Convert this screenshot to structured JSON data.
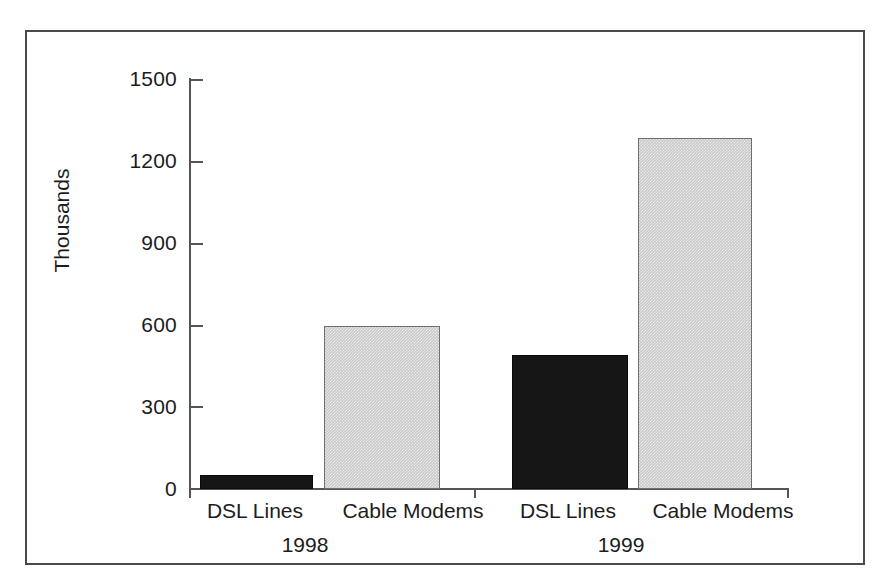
{
  "figure": {
    "background_color": "#ffffff",
    "frame_color": "#4a4a4a"
  },
  "chart_data": {
    "type": "bar",
    "title": "",
    "subtitle": "",
    "xlabel": "",
    "ylabel": "Thousands",
    "ylim": [
      0,
      1500
    ],
    "yticks": [
      0,
      300,
      600,
      900,
      1200,
      1500
    ],
    "ytick_labels": [
      "0",
      "300",
      "600",
      "900",
      "1200",
      "1500"
    ],
    "grid": false,
    "legend": "none",
    "groups": [
      "1998",
      "1999"
    ],
    "categories": [
      "DSL Lines",
      "Cable Modems"
    ],
    "series": [
      {
        "name": "DSL Lines",
        "color": "#161616",
        "values": [
          50,
          490
        ]
      },
      {
        "name": "Cable Modems",
        "color": "#c9c9c9",
        "values": [
          595,
          1285
        ]
      }
    ],
    "bars": [
      {
        "group": "1998",
        "category": "DSL Lines",
        "value": 50,
        "style": "dark"
      },
      {
        "group": "1998",
        "category": "Cable Modems",
        "value": 595,
        "style": "light"
      },
      {
        "group": "1999",
        "category": "DSL Lines",
        "value": 490,
        "style": "dark"
      },
      {
        "group": "1999",
        "category": "Cable Modems",
        "value": 1285,
        "style": "light"
      }
    ],
    "annotations": []
  },
  "axis_labels": {
    "g1_cat1": "DSL Lines",
    "g1_cat2": "Cable Modems",
    "g1_group": "1998",
    "g2_cat1": "DSL Lines",
    "g2_cat2": "Cable Modems",
    "g2_group": "1999"
  },
  "ytick_text": {
    "t0": "0",
    "t1": "300",
    "t2": "600",
    "t3": "900",
    "t4": "1200",
    "t5": "1500"
  }
}
